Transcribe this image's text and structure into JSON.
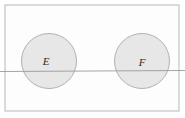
{
  "figure": {
    "type": "venn-diagram",
    "background_color": "#ffffff",
    "rule_color": "#9a9a9a"
  },
  "universe": {
    "name": "sample-space-rectangle",
    "x": 5,
    "y": 5,
    "width": 174,
    "height": 106,
    "stroke": "#b8b8b8",
    "fill": "#fdfdfd"
  },
  "sets": [
    {
      "label": "E",
      "name": "set-e",
      "cx": 49,
      "cy": 61,
      "r": 27.5,
      "fill": "#e7e7e7",
      "stroke": "#a9a9a9",
      "label_x": 46,
      "label_y": 62
    },
    {
      "label": "F",
      "name": "set-f",
      "cx": 142,
      "cy": 61,
      "r": 27.5,
      "fill": "#e7e7e7",
      "stroke": "#a9a9a9",
      "label_x": 142,
      "label_y": 63
    }
  ],
  "rule": {
    "name": "horizontal-rule",
    "x1": 0,
    "y1": 71.5,
    "x2": 185,
    "y2": 70.5,
    "stroke": "#9a9a9a",
    "stroke_width": 0.9
  }
}
